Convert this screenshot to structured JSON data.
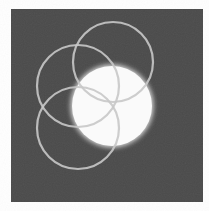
{
  "figure": {
    "background_color": "#ffffff",
    "panel": {
      "x": 11,
      "y": 9,
      "width": 192,
      "height": 193,
      "color": "#4a4a4a"
    },
    "glow_disc": {
      "cx": 112,
      "cy": 106,
      "r": 40,
      "fill": "#fafafa",
      "glow_color": "#ffffff"
    },
    "rings": [
      {
        "name": "ring-top",
        "cx": 113,
        "cy": 62,
        "r": 40,
        "stroke": "#c8c8c8",
        "stroke_width": 2.2
      },
      {
        "name": "ring-left",
        "cx": 78,
        "cy": 86,
        "r": 41,
        "stroke": "#c8c8c8",
        "stroke_width": 2.2
      },
      {
        "name": "ring-bottom-left",
        "cx": 78,
        "cy": 128,
        "r": 41,
        "stroke": "#c8c8c8",
        "stroke_width": 2.2
      }
    ]
  }
}
